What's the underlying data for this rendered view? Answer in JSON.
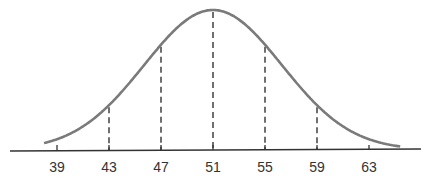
{
  "chart_data": {
    "type": "line",
    "title": "",
    "subtitle": "",
    "xlabel": "",
    "ylabel": "",
    "distribution": {
      "name": "normal",
      "mean": 51,
      "std_dev": 4
    },
    "x_ticks": [
      39,
      43,
      47,
      51,
      55,
      59,
      63
    ],
    "tick_labels": [
      "39",
      "43",
      "47",
      "51",
      "55",
      "59",
      "63"
    ],
    "dashed_lines_at": [
      43,
      47,
      51,
      55,
      59
    ],
    "xlim": [
      35.5,
      67.5
    ],
    "grid": false,
    "legend": "none",
    "colors": {
      "curve": "#7a7a7a",
      "axis": "#333333",
      "dashed": "#333333"
    }
  }
}
